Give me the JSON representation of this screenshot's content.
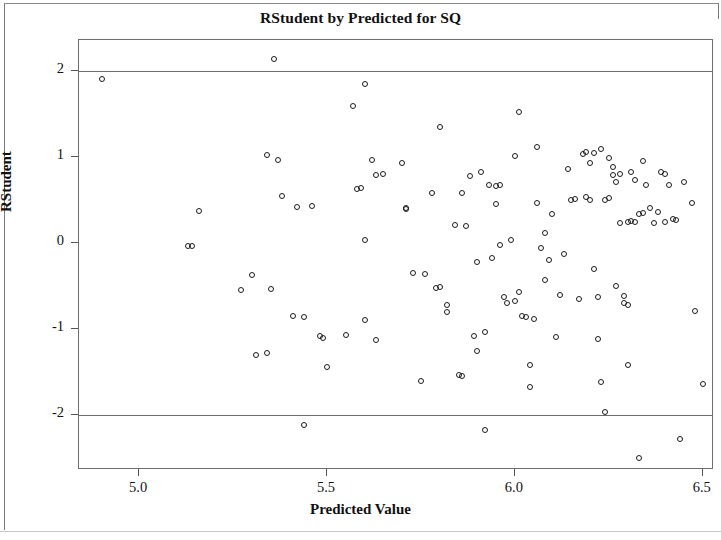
{
  "chart_data": {
    "type": "scatter",
    "title": "RStudent by Predicted for SQ",
    "xlabel": "Predicted Value",
    "ylabel": "RStudent",
    "xlim": [
      4.84,
      6.53
    ],
    "ylim": [
      -2.64,
      2.36
    ],
    "xticks": [
      5.0,
      5.5,
      6.0,
      6.5
    ],
    "xtick_labels": [
      "5.0",
      "5.5",
      "6.0",
      "6.5"
    ],
    "yticks": [
      2,
      1,
      0,
      -1,
      -2
    ],
    "ytick_labels": [
      "2",
      "1",
      "0",
      "-1",
      "-2"
    ],
    "grid": false,
    "legend": false,
    "marker": "open-circle",
    "marker_color": "#1c1c1c",
    "reference_lines": [
      {
        "axis": "y",
        "value": 2,
        "color": "#6d6d6d"
      },
      {
        "axis": "y",
        "value": -2,
        "color": "#6d6d6d"
      }
    ],
    "n_points": 136,
    "points": [
      [
        4.9,
        1.91
      ],
      [
        5.36,
        2.14
      ],
      [
        5.13,
        -0.03
      ],
      [
        5.14,
        -0.04
      ],
      [
        5.16,
        0.37
      ],
      [
        5.27,
        -0.55
      ],
      [
        5.3,
        -0.37
      ],
      [
        5.31,
        -1.3
      ],
      [
        5.34,
        1.02
      ],
      [
        5.34,
        -1.28
      ],
      [
        5.35,
        -0.54
      ],
      [
        5.37,
        0.97
      ],
      [
        5.38,
        0.55
      ],
      [
        5.41,
        -0.85
      ],
      [
        5.44,
        -2.12
      ],
      [
        5.46,
        0.43
      ],
      [
        5.48,
        -1.08
      ],
      [
        5.49,
        -1.1
      ],
      [
        5.5,
        -1.44
      ],
      [
        5.57,
        1.59
      ],
      [
        5.58,
        0.63
      ],
      [
        5.59,
        0.64
      ],
      [
        5.6,
        1.85
      ],
      [
        5.6,
        0.03
      ],
      [
        5.6,
        -0.89
      ],
      [
        5.62,
        0.96
      ],
      [
        5.63,
        0.79
      ],
      [
        5.63,
        -1.13
      ],
      [
        5.7,
        0.93
      ],
      [
        5.71,
        0.4
      ],
      [
        5.71,
        0.41
      ],
      [
        5.73,
        -0.35
      ],
      [
        5.75,
        -1.61
      ],
      [
        5.78,
        0.58
      ],
      [
        5.8,
        1.35
      ],
      [
        5.8,
        -0.51
      ],
      [
        5.82,
        -0.72
      ],
      [
        5.82,
        -0.8
      ],
      [
        5.84,
        0.21
      ],
      [
        5.85,
        -1.54
      ],
      [
        5.86,
        -1.55
      ],
      [
        5.88,
        0.78
      ],
      [
        5.89,
        -1.08
      ],
      [
        5.9,
        -0.22
      ],
      [
        5.9,
        -1.26
      ],
      [
        5.91,
        0.82
      ],
      [
        5.92,
        -1.03
      ],
      [
        5.92,
        -2.17
      ],
      [
        5.93,
        0.68
      ],
      [
        5.94,
        -0.18
      ],
      [
        5.95,
        0.66
      ],
      [
        5.96,
        -0.02
      ],
      [
        5.96,
        0.67
      ],
      [
        5.98,
        -0.7
      ],
      [
        6.0,
        1.01
      ],
      [
        6.01,
        1.52
      ],
      [
        6.01,
        -0.57
      ],
      [
        6.02,
        -0.85
      ],
      [
        6.03,
        -0.86
      ],
      [
        6.04,
        -1.42
      ],
      [
        6.04,
        -1.68
      ],
      [
        6.06,
        1.12
      ],
      [
        6.06,
        0.46
      ],
      [
        6.07,
        -0.06
      ],
      [
        6.08,
        0.12
      ],
      [
        6.08,
        -0.43
      ],
      [
        6.09,
        -0.2
      ],
      [
        6.1,
        0.34
      ],
      [
        6.11,
        -1.09
      ],
      [
        6.14,
        0.86
      ],
      [
        6.15,
        0.5
      ],
      [
        6.16,
        0.51
      ],
      [
        6.17,
        -0.65
      ],
      [
        6.18,
        1.04
      ],
      [
        6.19,
        1.06
      ],
      [
        6.19,
        0.53
      ],
      [
        6.2,
        0.93
      ],
      [
        6.2,
        0.5
      ],
      [
        6.21,
        -0.3
      ],
      [
        6.22,
        -0.63
      ],
      [
        6.22,
        -1.12
      ],
      [
        6.23,
        1.09
      ],
      [
        6.23,
        -1.62
      ],
      [
        6.24,
        0.5
      ],
      [
        6.24,
        -1.96
      ],
      [
        6.25,
        0.99
      ],
      [
        6.26,
        0.88
      ],
      [
        6.26,
        0.79
      ],
      [
        6.27,
        0.71
      ],
      [
        6.27,
        -0.5
      ],
      [
        6.28,
        0.23
      ],
      [
        6.29,
        -0.62
      ],
      [
        6.29,
        -0.7
      ],
      [
        6.3,
        -0.72
      ],
      [
        6.3,
        -1.42
      ],
      [
        6.31,
        0.83
      ],
      [
        6.32,
        0.73
      ],
      [
        6.32,
        0.24
      ],
      [
        6.33,
        -2.5
      ],
      [
        6.34,
        0.95
      ],
      [
        6.35,
        0.68
      ],
      [
        6.36,
        0.41
      ],
      [
        6.37,
        0.23
      ],
      [
        6.38,
        0.36
      ],
      [
        6.39,
        0.83
      ],
      [
        6.4,
        0.8
      ],
      [
        6.4,
        0.25
      ],
      [
        6.41,
        0.67
      ],
      [
        6.42,
        0.28
      ],
      [
        6.43,
        0.27
      ],
      [
        6.44,
        -2.28
      ],
      [
        6.45,
        0.71
      ],
      [
        6.47,
        0.46
      ],
      [
        6.48,
        -0.79
      ],
      [
        6.5,
        -1.64
      ],
      [
        5.42,
        0.42
      ],
      [
        5.95,
        0.45
      ],
      [
        6.05,
        -0.88
      ],
      [
        6.12,
        -0.6
      ],
      [
        6.13,
        -0.13
      ],
      [
        6.21,
        1.05
      ],
      [
        6.25,
        0.52
      ],
      [
        6.28,
        0.8
      ],
      [
        6.3,
        0.25
      ],
      [
        6.31,
        0.26
      ],
      [
        6.33,
        0.34
      ],
      [
        6.34,
        0.35
      ],
      [
        5.99,
        0.03
      ],
      [
        5.97,
        -0.63
      ],
      [
        6.0,
        -0.68
      ],
      [
        5.87,
        0.2
      ],
      [
        5.86,
        0.58
      ],
      [
        5.79,
        -0.52
      ],
      [
        5.76,
        -0.36
      ],
      [
        5.65,
        0.8
      ],
      [
        5.55,
        -1.07
      ],
      [
        5.44,
        -0.86
      ]
    ]
  }
}
